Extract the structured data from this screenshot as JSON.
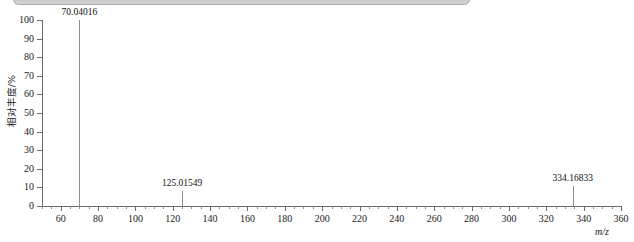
{
  "window": {
    "chrome_bar_color": "#c4c4c4"
  },
  "chart_data": {
    "type": "bar",
    "title": "",
    "subtitle": "",
    "xlabel": "m/z",
    "ylabel": "相对丰度/%",
    "xlim": [
      50,
      360
    ],
    "ylim": [
      0,
      100
    ],
    "grid": false,
    "legend": null,
    "x_major_step": 20,
    "x_minor_step": 5,
    "y_major_step": 10,
    "x_ticks": [
      60,
      80,
      100,
      120,
      140,
      160,
      180,
      200,
      220,
      240,
      260,
      280,
      300,
      320,
      340,
      360
    ],
    "y_ticks": [
      0,
      10,
      20,
      30,
      40,
      50,
      60,
      70,
      80,
      90,
      100
    ],
    "peak_color": "#8e8e8e",
    "axis_color": "#6b6b6b",
    "categories": [
      "70.04016",
      "125.01549",
      "334.16833"
    ],
    "values": [
      100,
      8,
      11
    ],
    "annotations": [
      {
        "label": "70.04016",
        "mz": 70.04016,
        "intensity": 100
      },
      {
        "label": "125.01549",
        "mz": 125.01549,
        "intensity": 8
      },
      {
        "label": "334.16833",
        "mz": 334.16833,
        "intensity": 11
      }
    ]
  }
}
